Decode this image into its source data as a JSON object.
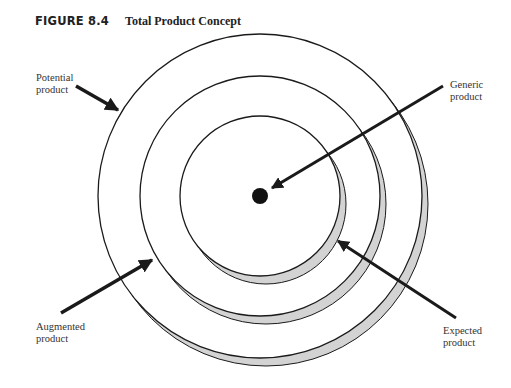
{
  "figure": {
    "number": "FIGURE 8.4",
    "title": "Total Product Concept"
  },
  "labels": {
    "potential": {
      "line1": "Potential",
      "line2": "product"
    },
    "generic": {
      "line1": "Generic",
      "line2": "product"
    },
    "augmented": {
      "line1": "Augmented",
      "line2": "product"
    },
    "expected": {
      "line1": "Expected",
      "line2": "product"
    }
  },
  "colors": {
    "stroke": "#1a1a1a",
    "shadow": "#d3d3d3",
    "background": "#ffffff"
  }
}
